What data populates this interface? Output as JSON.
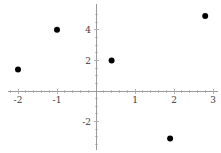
{
  "chart_data": {
    "type": "scatter",
    "title": "",
    "subtitle": "",
    "xlabel": "",
    "ylabel": "",
    "grid": false,
    "legend": null,
    "legend_position": "none",
    "xlim": [
      -2.45,
      3.2
    ],
    "ylim": [
      -3.6,
      5.3
    ],
    "xticks": [
      -2,
      -1,
      1,
      2,
      3
    ],
    "yticks": [
      4,
      2,
      -2
    ],
    "xticklabels": [
      "-2",
      "-1",
      "1",
      "2",
      "3"
    ],
    "yticklabels": [
      "4",
      "2",
      "-2"
    ],
    "x": [
      -2,
      -1,
      0.4,
      1.9,
      2.8
    ],
    "y": [
      1.4,
      4,
      2,
      -3.1,
      4.9
    ],
    "points": [
      {
        "x": -2,
        "y": 1.4
      },
      {
        "x": -1,
        "y": 4
      },
      {
        "x": 0.4,
        "y": 2
      },
      {
        "x": 1.9,
        "y": -3.1
      },
      {
        "x": 2.8,
        "y": 4.9
      }
    ],
    "marker": "circle",
    "marker_color": "#000000",
    "marker_size": 5,
    "axis_color": "#9a9a9a",
    "background_color": "#ffffff"
  },
  "axes": {
    "origin_px": {
      "x": 96,
      "y": 91
    },
    "x_unit_px": 39,
    "y_unit_px": 15.3
  }
}
